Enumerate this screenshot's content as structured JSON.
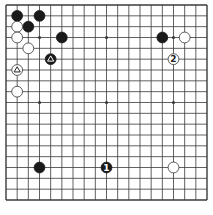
{
  "diagram": {
    "type": "go-board",
    "size": 19,
    "geometry": {
      "left": 6,
      "top": 5,
      "right": 207,
      "bottom": 200
    },
    "colors": {
      "background": "#ffffff",
      "line": "#3a3a3a",
      "black_stone": "#1a1a1a",
      "white_stone": "#ffffff",
      "white_stroke": "#333333"
    },
    "star_points": [
      [
        4,
        4
      ],
      [
        10,
        4
      ],
      [
        16,
        4
      ],
      [
        4,
        10
      ],
      [
        10,
        10
      ],
      [
        16,
        10
      ],
      [
        4,
        16
      ],
      [
        10,
        16
      ],
      [
        16,
        16
      ]
    ],
    "stones": [
      {
        "color": "black",
        "col": 2,
        "row": 2
      },
      {
        "color": "black",
        "col": 4,
        "row": 2
      },
      {
        "color": "black",
        "col": 3,
        "row": 3
      },
      {
        "color": "black",
        "col": 6,
        "row": 4
      },
      {
        "color": "black",
        "col": 5,
        "row": 6,
        "mark": "triangle"
      },
      {
        "color": "black",
        "col": 15,
        "row": 4
      },
      {
        "color": "black",
        "col": 4,
        "row": 16
      },
      {
        "color": "black",
        "col": 10,
        "row": 16,
        "label": "1"
      },
      {
        "color": "white",
        "col": 2,
        "row": 3
      },
      {
        "color": "white",
        "col": 2,
        "row": 4
      },
      {
        "color": "white",
        "col": 3,
        "row": 5
      },
      {
        "color": "white",
        "col": 2,
        "row": 7,
        "mark": "triangle"
      },
      {
        "color": "white",
        "col": 2,
        "row": 9
      },
      {
        "color": "white",
        "col": 17,
        "row": 4
      },
      {
        "color": "white",
        "col": 16,
        "row": 6,
        "label": "2"
      },
      {
        "color": "white",
        "col": 16,
        "row": 16
      }
    ]
  }
}
